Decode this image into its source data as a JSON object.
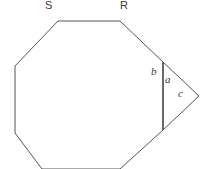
{
  "figure": {
    "background_color": "#ffffff",
    "stroke_color": "#555555",
    "stroke_width": 1,
    "canvas": {
      "width": 206,
      "height": 169
    },
    "vertex_labels": [
      {
        "name": "S",
        "text": "S",
        "x": 45,
        "y": 0
      },
      {
        "name": "R",
        "text": "R",
        "x": 120,
        "y": 0
      }
    ],
    "angle_labels": [
      {
        "name": "b",
        "text": "b",
        "x": 151,
        "y": 66
      },
      {
        "name": "a",
        "text": "a",
        "x": 165,
        "y": 74
      },
      {
        "name": "c",
        "text": "c",
        "x": 178,
        "y": 88
      }
    ],
    "shapes": {
      "polygon_points": "58,21 120,21 163,62 163,130 120,169 42,169 15,133 15,66",
      "triangle_points": "163,62 199,96 163,130",
      "chord_line": {
        "x1": 163,
        "y1": 62,
        "x2": 163,
        "y2": 130
      }
    }
  }
}
